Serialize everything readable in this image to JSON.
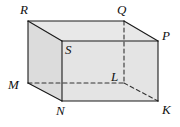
{
  "figure": {
    "name": "rectangular-prism",
    "background_color": "#ffffff",
    "stroke_color": "#1a1a1a",
    "hidden_stroke_color": "#333333",
    "top_face_color": "#e8e8e8",
    "left_face_color": "#dcdcdc",
    "front_face_color": "#e4e4e4",
    "stroke_width": 1.1,
    "hidden_dash_pattern": "4,3",
    "vertices": [
      {
        "id": "R",
        "label": "R",
        "x": 28,
        "y": 21,
        "hidden": false,
        "label_x": 20,
        "label_y": 3
      },
      {
        "id": "Q",
        "label": "Q",
        "x": 124,
        "y": 21,
        "hidden": false,
        "label_x": 117,
        "label_y": 3
      },
      {
        "id": "S",
        "label": "S",
        "x": 62,
        "y": 41,
        "hidden": false,
        "label_x": 65,
        "label_y": 43
      },
      {
        "id": "P",
        "label": "P",
        "x": 158,
        "y": 41,
        "hidden": false,
        "label_x": 162,
        "label_y": 29
      },
      {
        "id": "M",
        "label": "M",
        "x": 28,
        "y": 83,
        "hidden": false,
        "label_x": 8,
        "label_y": 78
      },
      {
        "id": "L",
        "label": "L",
        "x": 124,
        "y": 83,
        "hidden": true,
        "label_x": 111,
        "label_y": 70
      },
      {
        "id": "N",
        "label": "N",
        "x": 62,
        "y": 101,
        "hidden": false,
        "label_x": 56,
        "label_y": 104
      },
      {
        "id": "K",
        "label": "K",
        "x": 158,
        "y": 101,
        "hidden": false,
        "label_x": 162,
        "label_y": 103
      }
    ],
    "edges": [
      {
        "id": "R-Q",
        "from": "R",
        "to": "Q",
        "hidden": false
      },
      {
        "id": "R-S",
        "from": "R",
        "to": "S",
        "hidden": false
      },
      {
        "id": "R-M",
        "from": "R",
        "to": "M",
        "hidden": false
      },
      {
        "id": "Q-P",
        "from": "Q",
        "to": "P",
        "hidden": false
      },
      {
        "id": "Q-L",
        "from": "Q",
        "to": "L",
        "hidden": true
      },
      {
        "id": "S-P",
        "from": "S",
        "to": "P",
        "hidden": false
      },
      {
        "id": "S-N",
        "from": "S",
        "to": "N",
        "hidden": false
      },
      {
        "id": "P-K",
        "from": "P",
        "to": "K",
        "hidden": false
      },
      {
        "id": "M-N",
        "from": "M",
        "to": "N",
        "hidden": false
      },
      {
        "id": "M-L",
        "from": "M",
        "to": "L",
        "hidden": true
      },
      {
        "id": "N-K",
        "from": "N",
        "to": "K",
        "hidden": false
      },
      {
        "id": "L-K",
        "from": "L",
        "to": "K",
        "hidden": true
      }
    ],
    "faces": [
      {
        "id": "top",
        "vertices": [
          "R",
          "Q",
          "P",
          "S"
        ],
        "fill": "#e8e8e8"
      },
      {
        "id": "left",
        "vertices": [
          "R",
          "S",
          "N",
          "M"
        ],
        "fill": "#dcdcdc"
      },
      {
        "id": "front",
        "vertices": [
          "S",
          "P",
          "K",
          "N"
        ],
        "fill": "#e4e4e4"
      }
    ]
  }
}
